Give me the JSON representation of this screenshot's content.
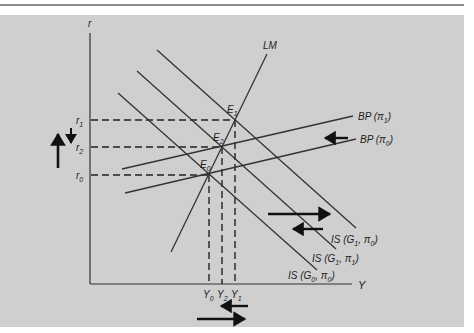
{
  "diagram": {
    "type": "IS-LM-BP model",
    "axes": {
      "y_label": "r",
      "x_label": "Y"
    },
    "curves": {
      "lm": "LM",
      "bp_pi1": "BP (π",
      "bp_pi1_sub": "1",
      "bp_pi0": "BP (π",
      "bp_pi0_sub": "0",
      "is_g1_pi0": "IS (G",
      "is_g1_pi0_sub1": "1",
      "is_g1_pi0_mid": ", π",
      "is_g1_pi0_sub2": "0",
      "is_g1_pi1": "IS (G",
      "is_g1_pi1_sub1": "1",
      "is_g1_pi1_mid": ", π",
      "is_g1_pi1_sub2": "1",
      "is_g0_pi0": "IS (G",
      "is_g0_pi0_sub1": "0",
      "is_g0_pi0_mid": ", π",
      "is_g0_pi0_sub2": "0",
      "close_paren": ")"
    },
    "equilibria": [
      {
        "label": "E",
        "sub": "1"
      },
      {
        "label": "E",
        "sub": "2"
      },
      {
        "label": "E",
        "sub": "0"
      }
    ],
    "r_ticks": [
      {
        "label": "r",
        "sub": "1"
      },
      {
        "label": "r",
        "sub": "2"
      },
      {
        "label": "r",
        "sub": "0"
      }
    ],
    "y_ticks": [
      {
        "label": "Y",
        "sub": "0"
      },
      {
        "label": "Y",
        "sub": "2"
      },
      {
        "label": "Y",
        "sub": "1"
      }
    ],
    "colors": {
      "background": "#cfcfcf",
      "line": "#333333",
      "arrow": "#111111"
    }
  }
}
